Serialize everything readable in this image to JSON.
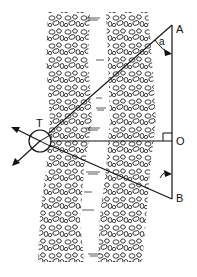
{
  "diagram": {
    "type": "river-width-survey",
    "labels": {
      "A": "A",
      "B": "B",
      "O": "O",
      "T": "T",
      "angle": "a"
    },
    "colors": {
      "ink": "#111111",
      "background": "#ffffff"
    },
    "elements": [
      "left gravel bank",
      "river channel",
      "right gravel bank",
      "theodolite circle T",
      "baseline A-O-B",
      "sight lines T-A, T-O, T-B",
      "right angle marker at O",
      "angle a at A"
    ]
  }
}
